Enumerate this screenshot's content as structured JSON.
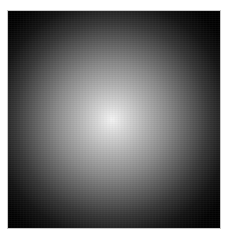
{
  "image": {
    "description": "Radial white glow on black background",
    "colors": {
      "background": "#000000",
      "center": "#f4f4f4",
      "frame_border": "#c8c8c8",
      "page_margin": "#ffffff"
    }
  }
}
